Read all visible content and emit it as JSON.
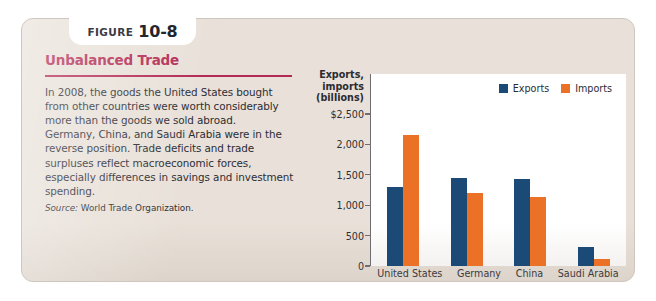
{
  "figure": {
    "tab_word": "FIGURE",
    "tab_number": "10-8",
    "title": "Unbalanced Trade",
    "body_paragraph_1": "In 2008, the goods the United States bought from other countries were worth considerably more than the goods we sold abroad.",
    "body_paragraph_2": "Germany, China, and Saudi Arabia were in the reverse position. Trade deficits and trade surpluses reflect macroeconomic forces, especially differences in savings and investment spending.",
    "source_label": "Source:",
    "source_text": "World Trade Organization."
  },
  "colors": {
    "exports": "#1b4a77",
    "imports": "#ea7125",
    "title": "#b32a52",
    "card_background": "#e9e1d9",
    "plot_background": "#ffffff"
  },
  "chart_data": {
    "type": "bar",
    "title": "",
    "axis_title_lines": [
      "Exports,",
      "imports",
      "(billions)"
    ],
    "categories": [
      "United States",
      "Germany",
      "China",
      "Saudi Arabia"
    ],
    "series": [
      {
        "name": "Exports",
        "values": [
          1300,
          1450,
          1430,
          310
        ]
      },
      {
        "name": "Imports",
        "values": [
          2150,
          1200,
          1130,
          110
        ]
      }
    ],
    "ytick_labels": [
      "$2,500",
      "2,000",
      "1,500",
      "1,000",
      "500",
      "0"
    ],
    "ytick_values": [
      2500,
      2000,
      1500,
      1000,
      500,
      0
    ],
    "ylim": [
      0,
      2500
    ],
    "xlabel": "",
    "ylabel": "Exports, imports (billions)",
    "grid": false,
    "legend_position": "top-right",
    "legend": [
      "Exports",
      "Imports"
    ]
  }
}
